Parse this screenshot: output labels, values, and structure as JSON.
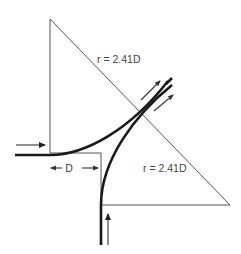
{
  "diagram": {
    "title": "",
    "labels": {
      "radius_upper": "r = 2.41D",
      "radius_lower": "r = 2.41D",
      "offset": "D"
    },
    "elements": [
      {
        "name": "upper-triangle",
        "type": "triangle"
      },
      {
        "name": "lower-triangle",
        "type": "triangle"
      },
      {
        "name": "horizontal-entry-path",
        "type": "thick-curve"
      },
      {
        "name": "vertical-entry-path",
        "type": "thick-curve"
      },
      {
        "name": "flow-arrows",
        "count": 4
      }
    ],
    "colors": {
      "thick_line": "#1a1a1a",
      "thin_line": "#555555",
      "text": "#444444",
      "background": "#ffffff"
    }
  }
}
